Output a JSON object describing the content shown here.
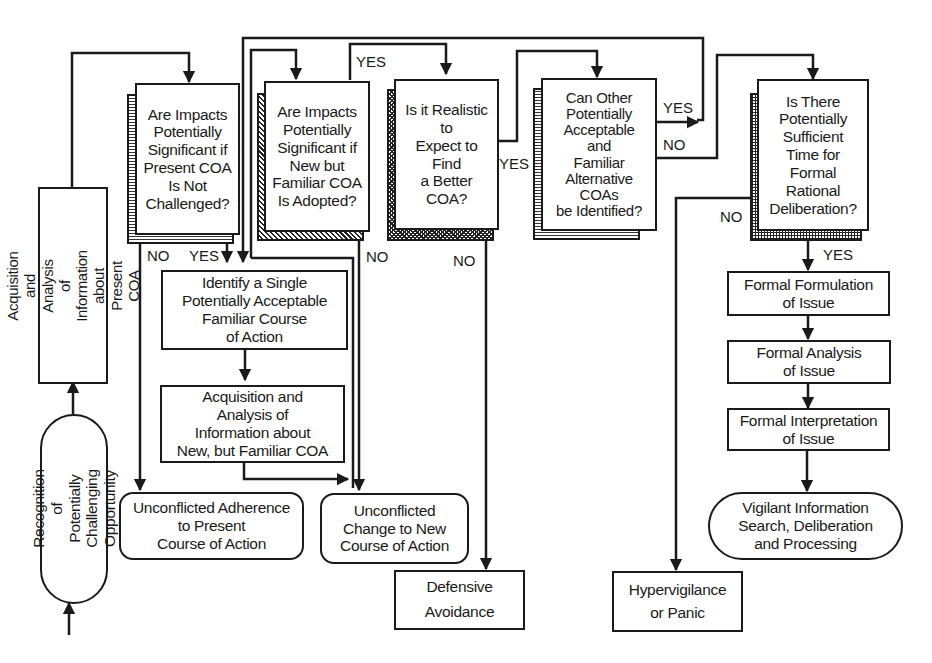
{
  "nodes": {
    "recognition": "Recognition of\nPotentially Challenging\nOpportunity",
    "acquisition_present": "Acquisition and Analysis\nof Information about\nPresent COA",
    "q1": "Are Impacts\nPotentially\nSignificant if\nPresent COA\nIs Not\nChallenged?",
    "q2": "Are Impacts\nPotentially\nSignificant if\nNew but\nFamiliar COA\nIs Adopted?",
    "q3": "Is it Realistic\nto\nExpect to\nFind\na Better\nCOA?",
    "q4": "Can Other\nPotentially\nAcceptable\nand\nFamiliar\nAlternative\nCOAs\nbe Identified?",
    "q5": "Is There\nPotentially\nSufficient\nTime for\nFormal\nRational\nDeliberation?",
    "identify": "Identify a Single\nPotentially Acceptable\nFamiliar Course\nof Action",
    "acquisition_new": "Acquisition and\nAnalysis of\nInformation about\nNew, but Familiar COA",
    "adherence": "Unconflicted Adherence\nto Present\nCourse of Action",
    "change": "Unconflicted\nChange to New\nCourse of Action",
    "defensive": "Defensive\nAvoidance",
    "hypervigilance": "Hypervigilance\nor Panic",
    "formulation": "Formal  Formulation\nof Issue",
    "analysis": "Formal  Analysis\nof Issue",
    "interpretation": "Formal Interpretation\nof Issue",
    "vigilant": "Vigilant Information\nSearch, Deliberation\nand Processing"
  },
  "edge_labels": {
    "q1_no": "NO",
    "q1_yes": "YES",
    "q2_yes": "YES",
    "q2_no": "NO",
    "q3_yes": "YES",
    "q3_no": "NO",
    "q4_yes": "YES",
    "q4_no": "NO",
    "q5_no": "NO",
    "q5_yes": "YES"
  },
  "colors": {
    "ink": "#1a1a1a",
    "background": "#ffffff"
  }
}
